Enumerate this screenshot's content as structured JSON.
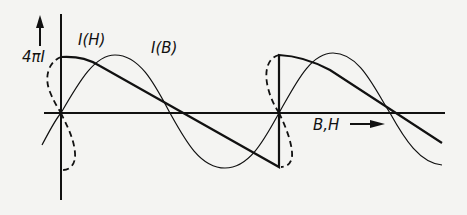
{
  "labels": {
    "y_axis": "4πI",
    "curve_h": "I(H)",
    "curve_b": "I(B)",
    "x_axis": "B,H"
  },
  "colors": {
    "background": "#f4f4f2",
    "ink": "#111111"
  }
}
